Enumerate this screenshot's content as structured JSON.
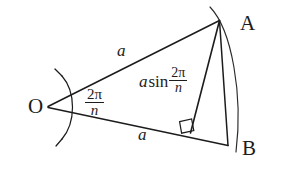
{
  "figure": {
    "type": "geometry-diagram",
    "background_color": "#ffffff",
    "stroke_color": "#1c1c1c",
    "points": {
      "O": {
        "label": "O",
        "x": 47,
        "y": 107
      },
      "A": {
        "label": "A",
        "x": 219,
        "y": 20
      },
      "B": {
        "label": "B",
        "x": 228,
        "y": 146
      },
      "foot": {
        "label": "",
        "x": 191,
        "y": 133
      }
    },
    "labels": {
      "vertex_o": "O",
      "vertex_a": "A",
      "vertex_b": "B",
      "side_upper": "a",
      "side_lower": "a",
      "height_coefficient": "a",
      "height_function": "sin",
      "numerator": "2π",
      "denominator": "n",
      "angle_numerator": "2π",
      "angle_denominator": "n"
    },
    "segments": [
      {
        "name": "side-oa",
        "from": "O",
        "to": "A",
        "label": "a"
      },
      {
        "name": "side-ob",
        "from": "O",
        "to": "B",
        "label": "a"
      },
      {
        "name": "chord-ab",
        "from": "A",
        "to": "B",
        "label": ""
      },
      {
        "name": "height-a-foot",
        "from": "A",
        "to": "foot",
        "label": "a sin 2π/n"
      },
      {
        "name": "base-foot-b",
        "from": "foot",
        "to": "B",
        "label": ""
      }
    ],
    "markers": {
      "right_angle": "right-angle-square",
      "angle_arc": "angle-arc-at-o",
      "circular_arc": "arc-from-a-to-b"
    }
  }
}
